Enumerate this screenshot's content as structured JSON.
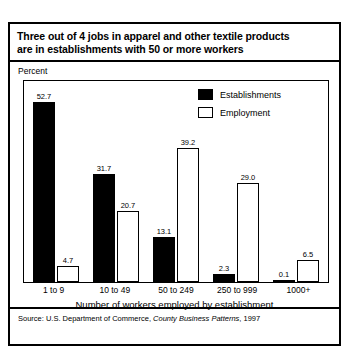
{
  "figure": {
    "title_line_1": "Three out of 4 jobs in apparel and other textile products",
    "title_line_2": "are in establishments with 50 or more workers",
    "unit_label": "Percent",
    "axis_title": "Number of workers employed by establishment",
    "source_prefix": "Source: U.S. Department of Commerce, ",
    "source_italic": "County Business Patterns",
    "source_suffix": ", 1997"
  },
  "colors": {
    "establishments": "#000000",
    "employment": "#ffffff",
    "outline": "#000000",
    "background": "#ffffff"
  },
  "chart_data": {
    "type": "bar",
    "title": "Three out of 4 jobs in apparel and other textile products are in establishments with 50 or more workers",
    "xlabel": "Number of workers employed by establishment",
    "ylabel": "Percent",
    "ylim": [
      0,
      56
    ],
    "grid": false,
    "legend_position": "top-right",
    "categories": [
      "1 to 9",
      "10 to 49",
      "50 to 249",
      "250 to 999",
      "1000+"
    ],
    "series": [
      {
        "name": "Establishments",
        "values": [
          52.7,
          31.7,
          13.1,
          2.3,
          0.1
        ],
        "labels": [
          "52.7",
          "31.7",
          "13.1",
          "2.3",
          "0.1"
        ]
      },
      {
        "name": "Employment",
        "values": [
          4.7,
          20.7,
          39.2,
          29.0,
          6.5
        ],
        "labels": [
          "4.7",
          "20.7",
          "39.2",
          "29.0",
          "6.5"
        ]
      }
    ]
  }
}
